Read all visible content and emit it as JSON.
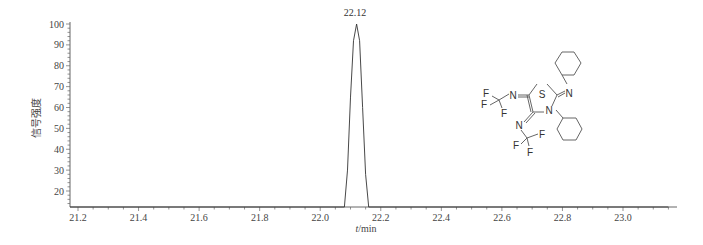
{
  "chart_data": {
    "type": "line",
    "title": "",
    "xlabel": "t/min",
    "ylabel": "信号强度",
    "xlim": [
      21.15,
      23.15
    ],
    "ylim": [
      14,
      100
    ],
    "x_ticks": [
      "21.2",
      "21.4",
      "21.6",
      "21.8",
      "22.0",
      "22.2",
      "22.4",
      "22.6",
      "22.8",
      "23.0"
    ],
    "y_ticks": [
      "20",
      "30",
      "40",
      "50",
      "60",
      "70",
      "80",
      "90",
      "100"
    ],
    "grid": false,
    "legend": null,
    "series": [
      {
        "name": "chromatogram",
        "x": [
          21.15,
          22.08,
          22.09,
          22.1,
          22.11,
          22.12,
          22.13,
          22.14,
          22.15,
          22.16,
          23.15
        ],
        "y": [
          14,
          14,
          30,
          65,
          92,
          100,
          92,
          60,
          28,
          14,
          14
        ]
      }
    ],
    "annotations": [
      {
        "text": "22.12",
        "x": 22.12,
        "y": 100,
        "type": "peak-label"
      }
    ],
    "inset": {
      "type": "chemical-structure",
      "atoms_labels": [
        "S",
        "N",
        "N",
        "N",
        "N",
        "F",
        "F",
        "F",
        "F",
        "F",
        "F"
      ],
      "description": "thiazole ring bearing two N-CF3 imines, N-phenyl and N-phenylimino substituents"
    }
  },
  "labels": {
    "peak": "22.12",
    "xlabel_italic": "t",
    "xlabel_unit": "/min",
    "ylabel": "信号强度"
  },
  "molecule": {
    "S": "S",
    "N": "N",
    "F": "F"
  }
}
